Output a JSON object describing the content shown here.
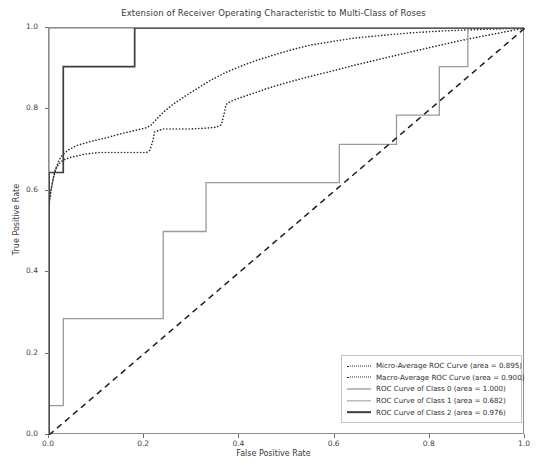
{
  "chart_data": {
    "type": "line",
    "title": "Extension of Receiver Operating Characteristic to Multi-Class of Roses",
    "xlabel": "False Positive Rate",
    "ylabel": "True Positive Rate",
    "xlim": [
      0.0,
      1.0
    ],
    "ylim": [
      0.0,
      1.0
    ],
    "xticks": [
      "0.0",
      "0.2",
      "0.4",
      "0.6",
      "0.8",
      "1.0"
    ],
    "yticks": [
      "0.0",
      "0.2",
      "0.4",
      "0.6",
      "0.8",
      "1.0"
    ],
    "xtick_values": [
      0.0,
      0.2,
      0.4,
      0.6,
      0.8,
      1.0
    ],
    "ytick_values": [
      0.0,
      0.2,
      0.4,
      0.6,
      0.8,
      1.0
    ],
    "grid": false,
    "legend_position": "lower right",
    "series": [
      {
        "name": "Micro-Average ROC Curve (area = 0.895)",
        "area": 0.895,
        "style": "dotted",
        "color": "#2b2b2b",
        "width": 1.6,
        "points": [
          [
            0.0,
            0.565
          ],
          [
            0.004,
            0.6
          ],
          [
            0.008,
            0.625
          ],
          [
            0.012,
            0.648
          ],
          [
            0.016,
            0.66
          ],
          [
            0.02,
            0.672
          ],
          [
            0.024,
            0.682
          ],
          [
            0.03,
            0.69
          ],
          [
            0.04,
            0.7
          ],
          [
            0.06,
            0.712
          ],
          [
            0.09,
            0.722
          ],
          [
            0.12,
            0.73
          ],
          [
            0.15,
            0.74
          ],
          [
            0.18,
            0.748
          ],
          [
            0.205,
            0.755
          ],
          [
            0.215,
            0.762
          ],
          [
            0.225,
            0.775
          ],
          [
            0.24,
            0.793
          ],
          [
            0.26,
            0.812
          ],
          [
            0.285,
            0.832
          ],
          [
            0.31,
            0.85
          ],
          [
            0.34,
            0.872
          ],
          [
            0.37,
            0.89
          ],
          [
            0.4,
            0.905
          ],
          [
            0.435,
            0.92
          ],
          [
            0.47,
            0.933
          ],
          [
            0.505,
            0.945
          ],
          [
            0.545,
            0.957
          ],
          [
            0.59,
            0.966
          ],
          [
            0.64,
            0.975
          ],
          [
            0.7,
            0.982
          ],
          [
            0.76,
            0.988
          ],
          [
            0.83,
            0.993
          ],
          [
            0.9,
            0.996
          ],
          [
            0.95,
            0.998
          ],
          [
            1.0,
            1.0
          ]
        ]
      },
      {
        "name": "Macro-Average ROC Curve (area = 0.900)",
        "area": 0.9,
        "style": "dotted",
        "color": "#2b2b2b",
        "width": 1.6,
        "points": [
          [
            0.0,
            0.57
          ],
          [
            0.005,
            0.608
          ],
          [
            0.01,
            0.635
          ],
          [
            0.015,
            0.655
          ],
          [
            0.022,
            0.668
          ],
          [
            0.03,
            0.676
          ],
          [
            0.045,
            0.682
          ],
          [
            0.06,
            0.686
          ],
          [
            0.075,
            0.69
          ],
          [
            0.09,
            0.692
          ],
          [
            0.105,
            0.694
          ],
          [
            0.12,
            0.694
          ],
          [
            0.15,
            0.694
          ],
          [
            0.18,
            0.694
          ],
          [
            0.205,
            0.694
          ],
          [
            0.212,
            0.7
          ],
          [
            0.218,
            0.722
          ],
          [
            0.222,
            0.745
          ],
          [
            0.24,
            0.752
          ],
          [
            0.27,
            0.752
          ],
          [
            0.3,
            0.752
          ],
          [
            0.33,
            0.754
          ],
          [
            0.35,
            0.756
          ],
          [
            0.362,
            0.762
          ],
          [
            0.368,
            0.79
          ],
          [
            0.372,
            0.812
          ],
          [
            0.382,
            0.82
          ],
          [
            0.4,
            0.828
          ],
          [
            0.43,
            0.84
          ],
          [
            0.46,
            0.852
          ],
          [
            0.5,
            0.866
          ],
          [
            0.545,
            0.88
          ],
          [
            0.59,
            0.893
          ],
          [
            0.64,
            0.908
          ],
          [
            0.69,
            0.922
          ],
          [
            0.74,
            0.936
          ],
          [
            0.8,
            0.952
          ],
          [
            0.86,
            0.968
          ],
          [
            0.92,
            0.982
          ],
          [
            1.0,
            1.0
          ]
        ]
      },
      {
        "name": "ROC Curve of Class 0 (area = 1.000)",
        "area": 1.0,
        "style": "solid",
        "color": "#7d7d7d",
        "width": 1.1,
        "points": [
          [
            0.0,
            0.0
          ],
          [
            0.0,
            1.0
          ],
          [
            1.0,
            1.0
          ]
        ]
      },
      {
        "name": "ROC Curve of Class 1 (area = 0.682)",
        "area": 0.682,
        "style": "solid",
        "color": "#9a9a9a",
        "width": 1.3,
        "points": [
          [
            0.0,
            0.0
          ],
          [
            0.0,
            0.072
          ],
          [
            0.03,
            0.072
          ],
          [
            0.03,
            0.286
          ],
          [
            0.24,
            0.286
          ],
          [
            0.24,
            0.5
          ],
          [
            0.33,
            0.5
          ],
          [
            0.33,
            0.62
          ],
          [
            0.61,
            0.62
          ],
          [
            0.61,
            0.714
          ],
          [
            0.73,
            0.714
          ],
          [
            0.73,
            0.786
          ],
          [
            0.82,
            0.786
          ],
          [
            0.82,
            0.905
          ],
          [
            0.88,
            0.905
          ],
          [
            0.88,
            1.0
          ],
          [
            1.0,
            1.0
          ]
        ]
      },
      {
        "name": "ROC Curve of Class 2 (area = 0.976)",
        "area": 0.976,
        "style": "solid",
        "color": "#3d3d3d",
        "width": 1.7,
        "points": [
          [
            0.0,
            0.0
          ],
          [
            0.0,
            0.645
          ],
          [
            0.03,
            0.645
          ],
          [
            0.03,
            0.905
          ],
          [
            0.18,
            0.905
          ],
          [
            0.18,
            1.0
          ],
          [
            1.0,
            1.0
          ]
        ]
      },
      {
        "name": "chance-diagonal",
        "style": "dashed",
        "color": "#1d1d1d",
        "width": 1.5,
        "points": [
          [
            0.0,
            0.0
          ],
          [
            1.0,
            1.0
          ]
        ]
      }
    ],
    "legend_entries": [
      {
        "label": "Micro-Average ROC Curve (area = 0.895)",
        "style": "dotted",
        "color": "#2b2b2b",
        "width": 1.6
      },
      {
        "label": "Macro-Average ROC Curve (area = 0.900)",
        "style": "dotted",
        "color": "#2b2b2b",
        "width": 1.6
      },
      {
        "label": "ROC Curve of Class 0 (area = 1.000)",
        "style": "solid",
        "color": "#7d7d7d",
        "width": 1.1
      },
      {
        "label": "ROC Curve of Class 1 (area = 0.682)",
        "style": "solid",
        "color": "#9a9a9a",
        "width": 1.3
      },
      {
        "label": "ROC Curve of Class 2 (area = 0.976)",
        "style": "solid",
        "color": "#3d3d3d",
        "width": 1.7
      }
    ]
  }
}
